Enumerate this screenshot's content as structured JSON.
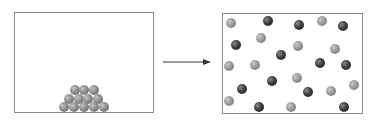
{
  "diagram": {
    "left_box": {
      "label": "initial-state",
      "rect": {
        "x": 14,
        "y": 12,
        "w": 140,
        "h": 101
      },
      "balls": [
        {
          "x": 75,
          "y": 90
        },
        {
          "x": 84,
          "y": 90
        },
        {
          "x": 94,
          "y": 90
        },
        {
          "x": 69,
          "y": 99
        },
        {
          "x": 79,
          "y": 99
        },
        {
          "x": 88,
          "y": 99
        },
        {
          "x": 98,
          "y": 99
        },
        {
          "x": 64,
          "y": 107
        },
        {
          "x": 74,
          "y": 107
        },
        {
          "x": 84,
          "y": 107
        },
        {
          "x": 94,
          "y": 107
        },
        {
          "x": 104,
          "y": 107
        }
      ]
    },
    "arrow": {
      "from": {
        "x": 163,
        "y": 62
      },
      "to": {
        "x": 209,
        "y": 62
      },
      "icon": "right-arrow-icon"
    },
    "right_box": {
      "label": "final-state",
      "rect": {
        "x": 222,
        "y": 13,
        "w": 141,
        "h": 101
      },
      "balls": [
        {
          "x": 231,
          "y": 23,
          "shade": "light"
        },
        {
          "x": 268,
          "y": 21,
          "shade": "dark"
        },
        {
          "x": 299,
          "y": 25,
          "shade": "dark"
        },
        {
          "x": 322,
          "y": 21,
          "shade": "light"
        },
        {
          "x": 343,
          "y": 26,
          "shade": "dark"
        },
        {
          "x": 236,
          "y": 45,
          "shade": "dark"
        },
        {
          "x": 261,
          "y": 38,
          "shade": "light"
        },
        {
          "x": 298,
          "y": 46,
          "shade": "light"
        },
        {
          "x": 281,
          "y": 55,
          "shade": "dark"
        },
        {
          "x": 335,
          "y": 49,
          "shade": "light"
        },
        {
          "x": 229,
          "y": 66,
          "shade": "light"
        },
        {
          "x": 255,
          "y": 65,
          "shade": "light"
        },
        {
          "x": 320,
          "y": 63,
          "shade": "dark"
        },
        {
          "x": 346,
          "y": 65,
          "shade": "dark"
        },
        {
          "x": 272,
          "y": 81,
          "shade": "dark"
        },
        {
          "x": 297,
          "y": 78,
          "shade": "light"
        },
        {
          "x": 242,
          "y": 89,
          "shade": "dark"
        },
        {
          "x": 308,
          "y": 92,
          "shade": "dark"
        },
        {
          "x": 331,
          "y": 91,
          "shade": "light"
        },
        {
          "x": 354,
          "y": 85,
          "shade": "light"
        },
        {
          "x": 229,
          "y": 101,
          "shade": "light"
        },
        {
          "x": 259,
          "y": 107,
          "shade": "dark"
        },
        {
          "x": 291,
          "y": 107,
          "shade": "light"
        },
        {
          "x": 344,
          "y": 107,
          "shade": "dark"
        }
      ]
    },
    "colors": {
      "border": "#8a8a8a",
      "light_ball": "#9a9a9a",
      "dark_ball": "#3c3c3c",
      "arrow": "#333333"
    }
  }
}
